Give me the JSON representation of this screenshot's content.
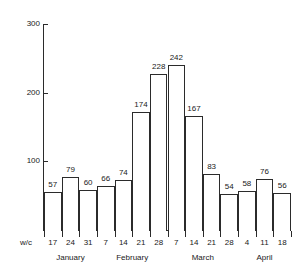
{
  "chart_data": {
    "type": "bar",
    "title": "",
    "subtitle": "",
    "xlabel": "w/c",
    "ylabel": "",
    "ylim": [
      0,
      300
    ],
    "yticks": [
      100,
      200,
      300
    ],
    "grid": false,
    "legend": null,
    "categories": [
      "17",
      "24",
      "31",
      "7",
      "14",
      "21",
      "28",
      "7",
      "14",
      "21",
      "28",
      "4",
      "11",
      "18"
    ],
    "values": [
      57,
      79,
      60,
      66,
      74,
      174,
      228,
      242,
      167,
      83,
      54,
      58,
      76,
      56
    ],
    "bar_labels": [
      "57",
      "79",
      "60",
      "66",
      "74",
      "174",
      "228",
      "242",
      "167",
      "83",
      "54",
      "58",
      "76",
      "56"
    ],
    "groups": [
      {
        "label": "January",
        "start": 0,
        "count": 3
      },
      {
        "label": "February",
        "start": 3,
        "count": 4
      },
      {
        "label": "March",
        "start": 7,
        "count": 4
      },
      {
        "label": "April",
        "start": 11,
        "count": 3
      }
    ],
    "ytick_labels": [
      "100",
      "200",
      "300"
    ]
  },
  "axis": {
    "wc_prefix": "w/c",
    "y_labels": [
      "300",
      "200",
      "100"
    ]
  }
}
